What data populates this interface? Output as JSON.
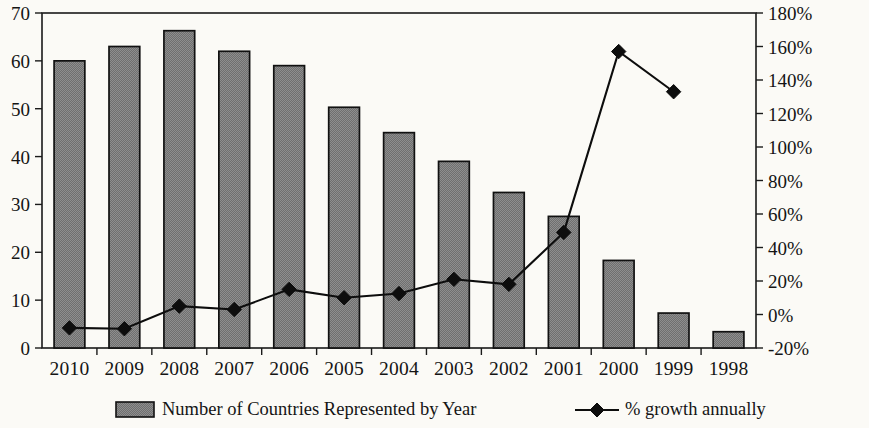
{
  "chart_data": {
    "type": "bar",
    "title": "",
    "subtitle": "",
    "xlabel": "",
    "ylabel": "",
    "y2label": "",
    "grid": false,
    "legend_position": "bottom",
    "categories": [
      "2010",
      "2009",
      "2008",
      "2007",
      "2006",
      "2005",
      "2004",
      "2003",
      "2002",
      "2001",
      "2000",
      "1999",
      "1998"
    ],
    "ylim": [
      0,
      70
    ],
    "yticks": [
      0,
      10,
      20,
      30,
      40,
      50,
      60,
      70
    ],
    "ytick_labels": [
      "0",
      "10",
      "20",
      "30",
      "40",
      "50",
      "60",
      "70"
    ],
    "y2lim": [
      -20,
      180
    ],
    "y2ticks": [
      -20,
      0,
      20,
      40,
      60,
      80,
      100,
      120,
      140,
      160,
      180
    ],
    "y2tick_labels": [
      "-20%",
      "0%",
      "20%",
      "40%",
      "60%",
      "80%",
      "100%",
      "120%",
      "140%",
      "160%",
      "180%"
    ],
    "series": [
      {
        "name": "Number of Countries Represented by Year",
        "type": "bar",
        "axis": "left",
        "color": "#7c7c7c",
        "edge_color": "#111111",
        "values": [
          60,
          63,
          66.3,
          62,
          59,
          50.3,
          45,
          39,
          32.5,
          27.5,
          18.3,
          7.3,
          3.4
        ]
      },
      {
        "name": "% growth annually",
        "type": "line",
        "axis": "right",
        "color": "#0d0d0d",
        "marker": "diamond",
        "values": [
          -8,
          -8.5,
          5,
          3,
          15,
          10,
          12.5,
          21,
          18,
          49,
          157,
          133,
          null
        ]
      }
    ]
  },
  "legend": {
    "items": [
      {
        "label": "Number of Countries Represented by Year",
        "marker": "filled-square-hatch",
        "color": "#7c7c7c"
      },
      {
        "label": "% growth annually",
        "marker": "line-with-diamond",
        "color": "#0d0d0d"
      }
    ]
  },
  "colors": {
    "background": "#fbfaf6",
    "axis": "#1a1a1a",
    "bar_fill": "#7c7c7c",
    "bar_edge": "#111111",
    "line": "#0d0d0d"
  }
}
